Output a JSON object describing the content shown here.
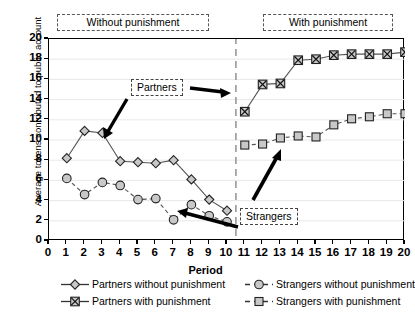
{
  "chart_data": {
    "type": "line",
    "title": "",
    "xlabel": "Period",
    "ylabel": "Average tokens contributed to public account",
    "xlim": [
      0,
      20
    ],
    "ylim": [
      0,
      20
    ],
    "xticks": [
      0,
      1,
      2,
      3,
      4,
      5,
      6,
      7,
      8,
      9,
      10,
      11,
      12,
      13,
      14,
      15,
      16,
      17,
      18,
      19,
      20
    ],
    "yticks": [
      0,
      2,
      4,
      6,
      8,
      10,
      12,
      14,
      16,
      18,
      20
    ],
    "grid": "horizontal-light",
    "legend_position": "below-axes",
    "phase_divider_x": 10.5,
    "series": [
      {
        "name": "Partners without punishment",
        "marker": "diamond",
        "linestyle": "solid",
        "x": [
          1,
          2,
          3,
          4,
          5,
          6,
          7,
          8,
          9,
          10
        ],
        "values": [
          8.2,
          10.9,
          10.7,
          7.9,
          7.8,
          7.7,
          8.0,
          6.1,
          4.1,
          3.0
        ]
      },
      {
        "name": "Partners with punishment",
        "marker": "x-in-square",
        "linestyle": "solid",
        "x": [
          11,
          12,
          13,
          14,
          15,
          16,
          17,
          18,
          19,
          20
        ],
        "values": [
          12.8,
          15.5,
          15.6,
          17.9,
          18.0,
          18.4,
          18.5,
          18.5,
          18.5,
          18.7
        ]
      },
      {
        "name": "Strangers without punishment",
        "marker": "circle",
        "linestyle": "dashed",
        "x": [
          1,
          2,
          3,
          4,
          5,
          6,
          7,
          8,
          9,
          10
        ],
        "values": [
          6.2,
          4.6,
          5.8,
          5.5,
          4.1,
          4.2,
          2.1,
          3.6,
          2.5,
          1.9
        ]
      },
      {
        "name": "Strangers with punishment",
        "marker": "square",
        "linestyle": "dashed",
        "x": [
          11,
          12,
          13,
          14,
          15,
          16,
          17,
          18,
          19,
          20
        ],
        "values": [
          9.5,
          9.6,
          10.2,
          10.4,
          10.3,
          11.5,
          12.1,
          12.3,
          12.6,
          12.6
        ]
      }
    ],
    "annotations": [
      {
        "id": "without-punishment",
        "text": "Without punishment"
      },
      {
        "id": "with-punishment",
        "text": "With punishment"
      },
      {
        "id": "partners",
        "text": "Partners"
      },
      {
        "id": "strangers",
        "text": "Strangers"
      }
    ],
    "colors": {
      "axis": "#000000",
      "marker_fill": "#c8c8c8",
      "line": "#555555",
      "grid": "#e8e8e8",
      "divider": "#999999"
    }
  },
  "axis": {
    "xlabel": "Period",
    "ylabel": "Average tokens contributed to public account",
    "xticks": [
      "0",
      "1",
      "2",
      "3",
      "4",
      "5",
      "6",
      "7",
      "8",
      "9",
      "10",
      "11",
      "12",
      "13",
      "14",
      "15",
      "16",
      "17",
      "18",
      "19",
      "20"
    ],
    "yticks": [
      "20",
      "18",
      "16",
      "14",
      "12",
      "10",
      "8",
      "6",
      "4",
      "2",
      "0"
    ]
  },
  "phases": {
    "left": "Without punishment",
    "right": "With punishment"
  },
  "callouts": {
    "partners": "Partners",
    "strangers": "Strangers"
  },
  "legend": {
    "items": [
      {
        "label": "Partners without punishment",
        "marker": "diamond-marker",
        "style": "solid"
      },
      {
        "label": "Strangers without punishment",
        "marker": "circle-marker",
        "style": "dashed"
      },
      {
        "label": "Partners with punishment",
        "marker": "x-square-marker",
        "style": "solid"
      },
      {
        "label": "Strangers with punishment",
        "marker": "square-marker",
        "style": "dashed"
      }
    ]
  }
}
